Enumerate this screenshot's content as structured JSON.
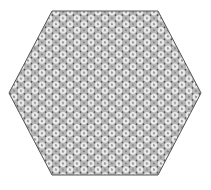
{
  "figure": {
    "shape": "hexagon",
    "colors": {
      "background": "#ffffff",
      "fill": "#b8b8b8",
      "outline": "#555555",
      "ring": "#eeeeee",
      "dot": "#555555"
    }
  }
}
